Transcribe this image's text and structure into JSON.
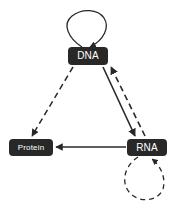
{
  "diagram": {
    "background_color": "#ffffff",
    "node_fill_color": "#282828",
    "node_text_color": "#ffffff",
    "edge_color": "#282828",
    "nodes": [
      {
        "id": "dna",
        "label": "DNA"
      },
      {
        "id": "protein",
        "label": "Protein"
      },
      {
        "id": "rna",
        "label": "RNA"
      }
    ],
    "edges": [
      {
        "id": "dna-self",
        "from": "DNA",
        "to": "DNA",
        "style": "solid",
        "shape": "self-loop-above",
        "arrow": true
      },
      {
        "id": "dna-to-rna",
        "from": "DNA",
        "to": "RNA",
        "style": "solid",
        "shape": "straight",
        "arrow": true
      },
      {
        "id": "rna-to-dna",
        "from": "RNA",
        "to": "DNA",
        "style": "dashed",
        "shape": "straight",
        "arrow": true
      },
      {
        "id": "rna-to-protein",
        "from": "RNA",
        "to": "Protein",
        "style": "solid",
        "shape": "straight",
        "arrow": true
      },
      {
        "id": "dna-to-protein",
        "from": "DNA",
        "to": "Protein",
        "style": "dashed",
        "shape": "straight",
        "arrow": true
      },
      {
        "id": "rna-self",
        "from": "RNA",
        "to": "RNA",
        "style": "dashed",
        "shape": "self-loop-below",
        "arrow": true
      }
    ]
  }
}
